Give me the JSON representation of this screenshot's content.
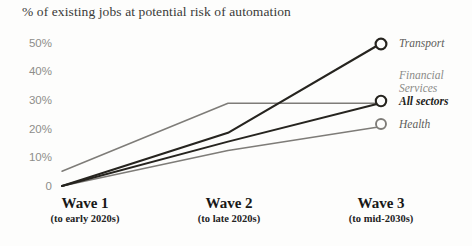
{
  "chart_data": {
    "type": "line",
    "title": "% of existing jobs at potential risk of automation",
    "xlabel": "",
    "ylabel": "",
    "ylim": [
      0,
      55
    ],
    "grid": false,
    "legend_position": "right-inline",
    "categories": [
      "Wave 1",
      "Wave 2",
      "Wave 3"
    ],
    "x_tick_labels": [
      "Wave 1",
      "Wave 2",
      "Wave 3"
    ],
    "x_tick_sublabels": [
      "(to early 2020s)",
      "(to late 2020s)",
      "(to mid-2030s)"
    ],
    "y_tick_labels": [
      "50%",
      "40%",
      "30%",
      "20%",
      "10%",
      "0"
    ],
    "y_tick_values": [
      50,
      40,
      30,
      20,
      10,
      0
    ],
    "series": [
      {
        "name": "Transport",
        "values": [
          2,
          20,
          50
        ],
        "color": "#26241f",
        "width": 2.1,
        "marker": "open-circle"
      },
      {
        "name": "Financial Services",
        "values": [
          7,
          30,
          30
        ],
        "color": "#7e7c78",
        "width": 1.5,
        "marker": "none"
      },
      {
        "name": "All sectors",
        "values": [
          2,
          17,
          30
        ],
        "color": "#26241f",
        "width": 2.0,
        "marker": "open-circle"
      },
      {
        "name": "Health",
        "values": [
          2,
          14,
          22
        ],
        "color": "#7e7c78",
        "width": 1.5,
        "marker": "open-circle"
      }
    ],
    "annotations": []
  },
  "legend": {
    "transport": "Transport",
    "financial_line1": "Financial",
    "financial_line2": "Services",
    "all_sectors": "All sectors",
    "health": "Health"
  },
  "axis": {
    "y0": "0",
    "y10": "10%",
    "y20": "20%",
    "y30": "30%",
    "y40": "40%",
    "y50": "50%",
    "w1_main": "Wave 1",
    "w1_sub": "(to early 2020s)",
    "w2_main": "Wave 2",
    "w2_sub": "(to late 2020s)",
    "w3_main": "Wave 3",
    "w3_sub": "(to mid-2030s)"
  },
  "colors": {
    "dark_line": "#26241f",
    "gray_line": "#7e7c78",
    "tick_text": "#8d8d8a",
    "title_text": "#3a3a38",
    "background": "#fdfdfc"
  }
}
